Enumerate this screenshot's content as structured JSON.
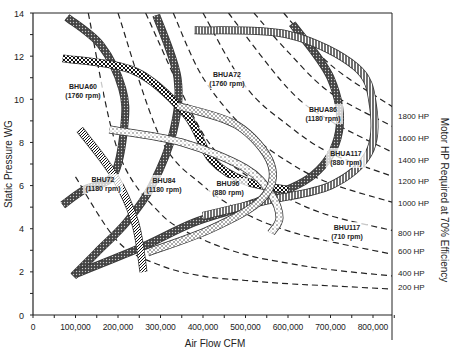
{
  "chart_data": {
    "type": "line",
    "title": "",
    "xlabel": "Air Flow CFM",
    "ylabel": "Static Pressure WG",
    "y2label": "Motor HP Required at 70% Efficiency",
    "xlim": [
      0,
      850000
    ],
    "ylim": [
      0,
      14
    ],
    "x_ticks": [
      "0",
      "100,000",
      "200,000",
      "300,000",
      "400,000",
      "500,000",
      "600,000",
      "700,000",
      "800,000"
    ],
    "y_ticks": [
      "0",
      "2",
      "4",
      "6",
      "8",
      "10",
      "12",
      "14"
    ],
    "grid": false,
    "hp_curves": [
      {
        "label": "200 HP",
        "points": [
          [
            100000,
            6.4
          ],
          [
            200000,
            3.4
          ],
          [
            300000,
            2.3
          ],
          [
            400000,
            1.8
          ],
          [
            500000,
            1.6
          ],
          [
            600000,
            1.45
          ],
          [
            700000,
            1.35
          ],
          [
            850000,
            1.2
          ]
        ]
      },
      {
        "label": "400 HP",
        "points": [
          [
            130000,
            14
          ],
          [
            200000,
            7.6
          ],
          [
            300000,
            4.7
          ],
          [
            400000,
            3.5
          ],
          [
            500000,
            2.8
          ],
          [
            600000,
            2.4
          ],
          [
            700000,
            2.1
          ],
          [
            850000,
            1.8
          ]
        ]
      },
      {
        "label": "600 HP",
        "points": [
          [
            200000,
            14
          ],
          [
            300000,
            8.2
          ],
          [
            400000,
            6.0
          ],
          [
            500000,
            4.7
          ],
          [
            600000,
            3.9
          ],
          [
            700000,
            3.4
          ],
          [
            850000,
            2.8
          ]
        ]
      },
      {
        "label": "800 HP",
        "points": [
          [
            265000,
            14
          ],
          [
            400000,
            8.4
          ],
          [
            500000,
            6.5
          ],
          [
            600000,
            5.4
          ],
          [
            700000,
            4.6
          ],
          [
            850000,
            3.9
          ]
        ]
      },
      {
        "label": "1000 HP",
        "points": [
          [
            330000,
            14
          ],
          [
            400000,
            11.0
          ],
          [
            500000,
            8.6
          ],
          [
            600000,
            7.1
          ],
          [
            700000,
            6.1
          ],
          [
            850000,
            5.2
          ]
        ]
      },
      {
        "label": "1200 HP",
        "points": [
          [
            400000,
            14
          ],
          [
            500000,
            10.6
          ],
          [
            600000,
            8.8
          ],
          [
            700000,
            7.5
          ],
          [
            850000,
            6.4
          ]
        ]
      },
      {
        "label": "1400 HP",
        "points": [
          [
            460000,
            14
          ],
          [
            600000,
            10.5
          ],
          [
            700000,
            9.0
          ],
          [
            850000,
            7.5
          ]
        ]
      },
      {
        "label": "1600 HP",
        "points": [
          [
            520000,
            14
          ],
          [
            600000,
            12.2
          ],
          [
            700000,
            10.3
          ],
          [
            850000,
            8.7
          ]
        ]
      },
      {
        "label": "1800 HP",
        "points": [
          [
            590000,
            14
          ],
          [
            700000,
            11.6
          ],
          [
            850000,
            9.6
          ]
        ]
      }
    ],
    "fan_curves": [
      {
        "name": "BHUA60",
        "speed": "(1760 rpm)",
        "points": [
          [
            80000,
            13.8
          ],
          [
            160000,
            12.5
          ],
          [
            210000,
            10.5
          ],
          [
            215000,
            8.8
          ],
          [
            190000,
            6.5
          ],
          [
            120000,
            5.8
          ],
          [
            70000,
            5.1
          ]
        ]
      },
      {
        "name": "BHUA72",
        "speed": "(1760 rpm)",
        "points": [
          [
            290000,
            13.9
          ],
          [
            340000,
            11.0
          ],
          [
            330000,
            8.5
          ],
          [
            280000,
            6.0
          ],
          [
            220000,
            4.3
          ],
          [
            150000,
            2.9
          ],
          [
            95000,
            1.8
          ]
        ]
      },
      {
        "name": "BHUA86",
        "speed": "(1180 rpm)",
        "points": [
          [
            610000,
            13.5
          ],
          [
            700000,
            11.0
          ],
          [
            720000,
            8.5
          ],
          [
            660000,
            6.5
          ],
          [
            520000,
            5.2
          ],
          [
            380000,
            4.3
          ],
          [
            250000,
            3.1
          ],
          [
            100000,
            1.9
          ]
        ]
      },
      {
        "name": "BHUA117",
        "speed": "(880 rpm)",
        "points": [
          [
            380000,
            13.2
          ],
          [
            600000,
            13.0
          ],
          [
            760000,
            11.5
          ],
          [
            800000,
            9.7
          ],
          [
            790000,
            7.5
          ],
          [
            700000,
            6.0
          ],
          [
            550000,
            5.3
          ],
          [
            400000,
            4.6
          ]
        ]
      },
      {
        "name": "BHU72",
        "speed": "(1180 rpm)",
        "points": [
          [
            110000,
            8.6
          ],
          [
            190000,
            6.5
          ],
          [
            240000,
            4.3
          ],
          [
            260000,
            2.0
          ]
        ]
      },
      {
        "name": "BHU84",
        "speed": "(1180 rpm)",
        "points": [
          [
            70000,
            11.9
          ],
          [
            240000,
            11.3
          ],
          [
            360000,
            9.3
          ],
          [
            420000,
            7.2
          ],
          [
            500000,
            6.2
          ],
          [
            600000,
            5.8
          ]
        ]
      },
      {
        "name": "BHU96",
        "speed": "(880 rpm)",
        "points": [
          [
            180000,
            8.6
          ],
          [
            350000,
            8.0
          ],
          [
            500000,
            6.8
          ],
          [
            560000,
            5.6
          ],
          [
            580000,
            4.5
          ],
          [
            560000,
            3.8
          ]
        ]
      },
      {
        "name": "BHU117",
        "speed": "(710 rpm)",
        "points": [
          [
            340000,
            9.7
          ],
          [
            480000,
            8.8
          ],
          [
            560000,
            7.0
          ],
          [
            540000,
            5.4
          ],
          [
            420000,
            4.0
          ],
          [
            270000,
            2.9
          ]
        ]
      }
    ],
    "right_labels": [
      "1800 HP",
      "1600 HP",
      "1400 HP",
      "1200 HP",
      "1000 HP",
      "800 HP",
      "600 HP",
      "400 HP",
      "200 HP"
    ]
  }
}
